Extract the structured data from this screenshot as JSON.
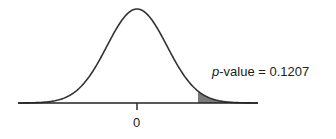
{
  "chart_data": {
    "type": "area",
    "title": "",
    "distribution": "normal",
    "mean": 0,
    "x_tick_labels": [
      "0"
    ],
    "shaded_region": "right tail",
    "annotation": {
      "variable": "p",
      "text_suffix": "-value = 0.1207",
      "value": 0.1207
    },
    "xlabel": "",
    "ylabel": "",
    "grid": false,
    "colors": {
      "curve": "#333333",
      "shade": "#7a7a7a",
      "axis": "#222222"
    }
  }
}
